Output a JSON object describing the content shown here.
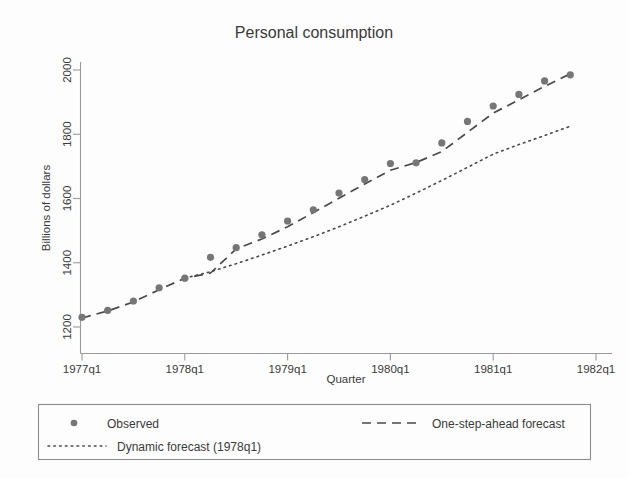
{
  "chart_data": {
    "type": "line",
    "title": "Personal consumption",
    "xlabel": "Quarter",
    "ylabel": "Billions of dollars",
    "grid": false,
    "legend_position": "below-bottom",
    "x": [
      "1977q1",
      "1977q2",
      "1977q3",
      "1977q4",
      "1978q1",
      "1978q2",
      "1978q3",
      "1978q4",
      "1979q1",
      "1979q2",
      "1979q3",
      "1979q4",
      "1980q1",
      "1980q2",
      "1980q3",
      "1980q4",
      "1981q1",
      "1981q2",
      "1981q3",
      "1981q4"
    ],
    "x_tick_labels": [
      "1977q1",
      "1978q1",
      "1979q1",
      "1980q1",
      "1981q1",
      "1982q1"
    ],
    "x_tick_values": [
      "1977q1",
      "1978q1",
      "1979q1",
      "1980q1",
      "1981q1",
      "1982q1"
    ],
    "xlim": [
      "1977q1",
      "1982q1"
    ],
    "y_tick_labels": [
      "1200",
      "1400",
      "1600",
      "1800",
      "2000"
    ],
    "y_tick_values": [
      1200,
      1400,
      1600,
      1800,
      2000
    ],
    "ylim": [
      1190,
      2010
    ],
    "series": [
      {
        "name": "Observed",
        "style": "markers",
        "marker": "circle",
        "color": "#767676",
        "values": [
          1230,
          1252,
          1281,
          1322,
          1352,
          1417,
          1447,
          1487,
          1530,
          1565,
          1617,
          1659,
          1709,
          1711,
          1773,
          1840,
          1888,
          1924,
          1966,
          1985
        ]
      },
      {
        "name": "One-step-ahead forecast",
        "style": "dashed",
        "color": "#4a4a4a",
        "values": [
          1228,
          1250,
          1278,
          1316,
          1352,
          1368,
          1443,
          1474,
          1512,
          1556,
          1601,
          1645,
          1688,
          1712,
          1746,
          1806,
          1866,
          1907,
          1949,
          1988
        ]
      },
      {
        "name": "Dynamic forecast (1978q1)",
        "style": "dotted",
        "color": "#4a4a4a",
        "start": "1978q1",
        "values": [
          null,
          null,
          null,
          null,
          1352,
          1372,
          1397,
          1424,
          1452,
          1481,
          1512,
          1545,
          1579,
          1617,
          1656,
          1697,
          1738,
          1768,
          1796,
          1825
        ]
      }
    ],
    "legend": [
      {
        "label": "Observed",
        "marker": "dot"
      },
      {
        "label": "One-step-ahead forecast",
        "marker": "dashed-line"
      },
      {
        "label": "Dynamic forecast (1978q1)",
        "marker": "dotted-line"
      }
    ],
    "colors": {
      "observed": "#767676",
      "forecast_line": "#4a4a4a",
      "axis": "#9a9a9a",
      "text": "#3a3a3a",
      "background": "#fdfdfd"
    }
  }
}
